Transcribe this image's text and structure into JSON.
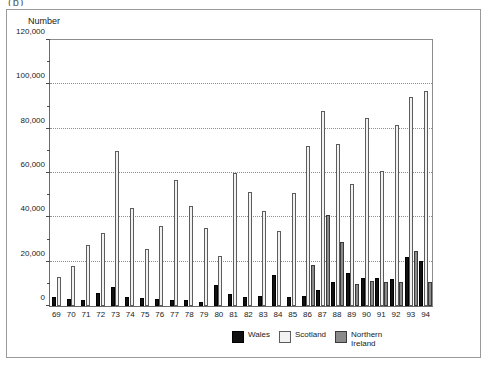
{
  "top_fragment": "(b)",
  "chart_data": {
    "type": "bar",
    "title": "",
    "xlabel": "",
    "ylabel": "Number",
    "ylim": [
      0,
      120000
    ],
    "ytick_values": [
      0,
      20000,
      40000,
      60000,
      80000,
      100000,
      120000
    ],
    "ytick_labels": [
      "0",
      "20,000",
      "40,000",
      "60,000",
      "80,000",
      "100,000",
      "120,000"
    ],
    "yminor_values": [
      10000,
      30000,
      50000,
      70000,
      90000,
      110000
    ],
    "grid": true,
    "grid_axis": "y",
    "legend_position": "bottom",
    "categories": [
      "69",
      "70",
      "71",
      "72",
      "73",
      "74",
      "75",
      "76",
      "77",
      "78",
      "79",
      "80",
      "81",
      "82",
      "83",
      "84",
      "85",
      "86",
      "87",
      "88",
      "89",
      "90",
      "91",
      "92",
      "93",
      "94"
    ],
    "series": [
      {
        "name": "Wales",
        "color": "#111111",
        "values": [
          4000,
          3000,
          2500,
          6000,
          8500,
          4000,
          3500,
          3000,
          2500,
          2500,
          2000,
          9500,
          5500,
          4000,
          4500,
          14000,
          4000,
          4500,
          7000,
          11000,
          15000,
          12500,
          12500,
          12000,
          22000,
          20500
        ]
      },
      {
        "name": "Scotland",
        "color": "#f2f2f2",
        "values": [
          13000,
          18000,
          27500,
          33000,
          70000,
          44000,
          25500,
          36000,
          57000,
          45000,
          35000,
          22500,
          60000,
          51500,
          43000,
          34000,
          51000,
          72000,
          88000,
          73000,
          55000,
          85000,
          61000,
          81500,
          94500,
          97000
        ]
      },
      {
        "name": "Northern Ireland",
        "color": "#8a8a8a",
        "values": [
          null,
          null,
          null,
          null,
          null,
          null,
          null,
          null,
          null,
          null,
          null,
          null,
          null,
          null,
          null,
          null,
          null,
          18500,
          41000,
          29000,
          10000,
          11500,
          11000,
          11000,
          25000,
          11000
        ]
      }
    ]
  },
  "legend": {
    "items": [
      {
        "label": "Wales",
        "swatch": "wales"
      },
      {
        "label": "Scotland",
        "swatch": "scotland"
      },
      {
        "label": "Northern Ireland",
        "swatch": "nireland"
      }
    ]
  }
}
